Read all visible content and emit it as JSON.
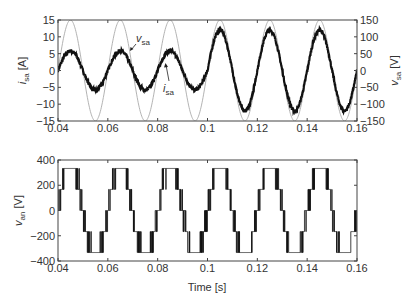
{
  "chart_data": [
    {
      "type": "line",
      "title": "",
      "xlabel": "",
      "ylabel": "i_sa [A]",
      "ylabel_right": "v_sa [V]",
      "xlim": [
        0.04,
        0.16
      ],
      "ylim": [
        -15,
        15
      ],
      "ylim_right": [
        -150,
        150
      ],
      "xticks": [
        "0.04",
        "0.06",
        "0.08",
        "0.1",
        "0.12",
        "0.14",
        "0.16"
      ],
      "yticks": [
        "15",
        "10",
        "5",
        "0",
        "-5",
        "-10",
        "-15"
      ],
      "yticks_right": [
        "150",
        "100",
        "50",
        "0",
        "-50",
        "-100",
        "-150"
      ],
      "grid": false,
      "frequency_hz": 50,
      "series": [
        {
          "name": "v_sa",
          "axis": "right",
          "color": "#aaaaaa",
          "amplitude": 150,
          "phase_note": "sinusoid, peak at t≈0.045"
        },
        {
          "name": "i_sa",
          "axis": "left",
          "color": "#111111",
          "segments": [
            {
              "t_start": 0.04,
              "t_end": 0.1,
              "amplitude": 5.8
            },
            {
              "t_start": 0.1,
              "t_end": 0.16,
              "amplitude": 12
            }
          ],
          "phase_note": "in phase with v_sa, noisy (switching ripple)"
        }
      ],
      "annotations": [
        {
          "text": "v_sa",
          "x": 0.072,
          "y": 9
        },
        {
          "text": "i_sa",
          "x": 0.084,
          "y": -2
        }
      ]
    },
    {
      "type": "line",
      "title": "",
      "xlabel": "Time [s]",
      "ylabel": "v_an [V]",
      "xlim": [
        0.04,
        0.16
      ],
      "ylim": [
        -400,
        400
      ],
      "xticks": [
        "0.04",
        "0.06",
        "0.08",
        "0.1",
        "0.12",
        "0.14",
        "0.16"
      ],
      "yticks": [
        "400",
        "200",
        "0",
        "-200",
        "-400"
      ],
      "grid": false,
      "series": [
        {
          "name": "v_an",
          "color": "#111111",
          "levels": [
            -333,
            -167,
            0,
            167,
            333
          ],
          "description": "multilevel PWM staircase waveform, 50 Hz"
        }
      ]
    }
  ],
  "labels": {
    "top_ylabel_main": "i",
    "top_ylabel_sub": "sa",
    "top_ylabel_unit": " [A]",
    "top_ylabel_right_main": "v",
    "top_ylabel_right_sub": "sa",
    "top_ylabel_right_unit": " [V]",
    "bottom_ylabel_main": "v",
    "bottom_ylabel_sub": "an",
    "bottom_ylabel_unit": " [V]",
    "xlabel": "Time [s]",
    "ann_v_main": "v",
    "ann_v_sub": "sa",
    "ann_i_main": "i",
    "ann_i_sub": "sa"
  }
}
